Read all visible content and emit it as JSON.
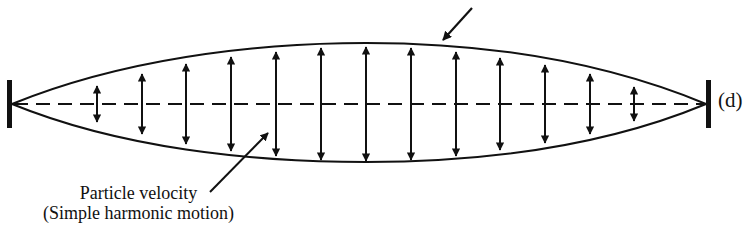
{
  "figure": {
    "part_label": "(d)",
    "annotation": {
      "line1": "Particle velocity",
      "line2": "(Simple harmonic motion)"
    },
    "colors": {
      "ink": "#111111",
      "background": "#ffffff"
    },
    "string": {
      "left_fixed_end_x": 10,
      "right_fixed_end_x": 708,
      "axis_y": 104,
      "envelope_top_min_y": 43,
      "envelope_bottom_max_y": 162,
      "mode": "fundamental"
    },
    "velocity_arrows": [
      {
        "x": 97,
        "half_len": 18
      },
      {
        "x": 142,
        "half_len": 30
      },
      {
        "x": 186,
        "half_len": 40
      },
      {
        "x": 231,
        "half_len": 47
      },
      {
        "x": 276,
        "half_len": 52
      },
      {
        "x": 321,
        "half_len": 56
      },
      {
        "x": 366,
        "half_len": 57
      },
      {
        "x": 411,
        "half_len": 56
      },
      {
        "x": 456,
        "half_len": 52
      },
      {
        "x": 500,
        "half_len": 46
      },
      {
        "x": 545,
        "half_len": 39
      },
      {
        "x": 590,
        "half_len": 30
      },
      {
        "x": 634,
        "half_len": 17
      }
    ]
  }
}
